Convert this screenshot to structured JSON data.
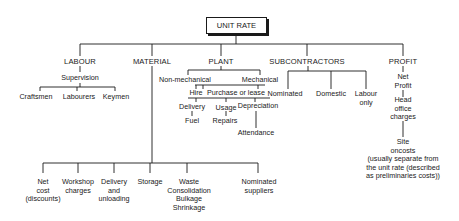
{
  "root": "UNIT RATE",
  "categories": {
    "labour": {
      "title": "LABOUR",
      "sub": "Supervision",
      "children": [
        "Craftsmen",
        "Labourers",
        "Keymen"
      ]
    },
    "material": {
      "title": "MATERIAL",
      "children": [
        "Net\ncost\n(discounts)",
        "Workshop\ncharges",
        "Delivery\nand\nunloading",
        "Storage",
        "Waste\nConsolidation\nBulkage\nShrinkage",
        "Nominated\nsuppliers"
      ]
    },
    "plant": {
      "title": "PLANT",
      "types": [
        "Non-mechanical",
        "Mechanical"
      ],
      "acquisition": [
        "Hire",
        "Purchase or lease"
      ],
      "costs": [
        "Delivery",
        "Usage",
        "Depreciation"
      ],
      "sub_costs": [
        "Fuel",
        "Repairs",
        "Attendance"
      ]
    },
    "subcontractors": {
      "title": "SUBCONTRACTORS",
      "children": [
        "Nominated",
        "Domestic",
        "Labour\nonly"
      ]
    },
    "profit": {
      "title": "PROFIT",
      "chain": [
        "Net\nProfit",
        "Head\noffice\ncharges",
        "Site\noncosts\n(usually separate from\nthe unit rate (described\nas preliminaries costs))"
      ]
    }
  }
}
